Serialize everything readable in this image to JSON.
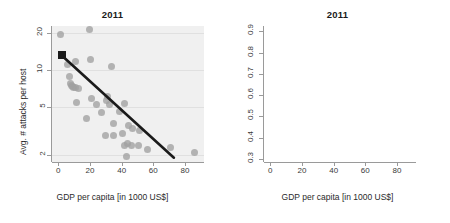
{
  "figure": {
    "background_color": "#ffffff",
    "panel_background_color": "#f0f0f0",
    "point_color": "#a0a0a0",
    "trend_color": "#1a1a1a",
    "marker_color": "#1a1a1a"
  },
  "chart_data": [
    {
      "type": "scatter",
      "title": "2011",
      "xlabel": "GDP per capita [in 1000 US$]",
      "ylabel": "Avg. # attacks per host",
      "xlim": [
        -4,
        92
      ],
      "ylim": [
        1.75,
        23
      ],
      "yscale": "log",
      "xscale": "linear",
      "grid": true,
      "legend": "none",
      "xticks": [
        0,
        20,
        40,
        60,
        80
      ],
      "yticks": [
        2,
        5,
        10,
        20
      ],
      "points": [
        {
          "x": 1.5,
          "y": 19.6
        },
        {
          "x": 2.0,
          "y": 13.2
        },
        {
          "x": 5.5,
          "y": 11.0
        },
        {
          "x": 7.0,
          "y": 8.9
        },
        {
          "x": 7.5,
          "y": 7.8
        },
        {
          "x": 8.0,
          "y": 7.5
        },
        {
          "x": 9.0,
          "y": 7.3
        },
        {
          "x": 9.5,
          "y": 7.2
        },
        {
          "x": 10.5,
          "y": 7.2
        },
        {
          "x": 11.0,
          "y": 11.8
        },
        {
          "x": 11.5,
          "y": 5.4
        },
        {
          "x": 13.0,
          "y": 7.1
        },
        {
          "x": 17.5,
          "y": 4.0
        },
        {
          "x": 19.5,
          "y": 21.5
        },
        {
          "x": 20.0,
          "y": 12.3
        },
        {
          "x": 21.0,
          "y": 5.8
        },
        {
          "x": 24.0,
          "y": 5.2
        },
        {
          "x": 27.5,
          "y": 4.5
        },
        {
          "x": 29.5,
          "y": 2.9
        },
        {
          "x": 30.5,
          "y": 5.6
        },
        {
          "x": 31.0,
          "y": 6.0
        },
        {
          "x": 32.5,
          "y": 5.2
        },
        {
          "x": 33.5,
          "y": 10.7
        },
        {
          "x": 34.5,
          "y": 3.6
        },
        {
          "x": 35.0,
          "y": 2.9
        },
        {
          "x": 38.5,
          "y": 4.6
        },
        {
          "x": 40.5,
          "y": 3.0
        },
        {
          "x": 41.5,
          "y": 5.3
        },
        {
          "x": 42.0,
          "y": 2.4
        },
        {
          "x": 43.0,
          "y": 1.95
        },
        {
          "x": 43.5,
          "y": 2.5
        },
        {
          "x": 44.5,
          "y": 3.5
        },
        {
          "x": 46.0,
          "y": 2.4
        },
        {
          "x": 47.0,
          "y": 3.3
        },
        {
          "x": 50.5,
          "y": 2.4
        },
        {
          "x": 51.5,
          "y": 3.2
        },
        {
          "x": 56.5,
          "y": 2.2
        },
        {
          "x": 70.5,
          "y": 2.3
        },
        {
          "x": 86.0,
          "y": 2.1
        }
      ],
      "trend": {
        "style": "straight-on-log",
        "start": {
          "x": 2.0,
          "y": 13.2
        },
        "end": {
          "x": 73.0,
          "y": 1.9
        }
      },
      "highlight_marker": {
        "x": 2.0,
        "y": 13.2,
        "shape": "square"
      }
    },
    {
      "type": "scatter",
      "title": "2011",
      "xlabel": "GDP per capita [in 1000 US$]",
      "ylabel": "% attacked hosts",
      "xlim": [
        -4,
        92
      ],
      "ylim": [
        0.285,
        0.925
      ],
      "yscale": "linear",
      "xscale": "linear",
      "grid": true,
      "legend": "none",
      "xticks": [
        0,
        20,
        40,
        60,
        80
      ],
      "yticks": [
        0.3,
        0.4,
        0.5,
        0.6,
        0.7,
        0.8,
        0.9
      ],
      "points": [
        {
          "x": 1.0,
          "y": 0.805
        },
        {
          "x": 2.0,
          "y": 0.79
        },
        {
          "x": 2.5,
          "y": 0.77
        },
        {
          "x": 3.5,
          "y": 0.73
        },
        {
          "x": 4.5,
          "y": 0.82
        },
        {
          "x": 5.0,
          "y": 0.69
        },
        {
          "x": 5.5,
          "y": 0.655
        },
        {
          "x": 6.0,
          "y": 0.66
        },
        {
          "x": 6.5,
          "y": 0.63
        },
        {
          "x": 7.5,
          "y": 0.775
        },
        {
          "x": 9.5,
          "y": 0.76
        },
        {
          "x": 10.5,
          "y": 0.755
        },
        {
          "x": 11.0,
          "y": 0.75
        },
        {
          "x": 11.5,
          "y": 0.72
        },
        {
          "x": 12.0,
          "y": 0.595
        },
        {
          "x": 13.0,
          "y": 0.7
        },
        {
          "x": 17.5,
          "y": 0.515
        },
        {
          "x": 19.0,
          "y": 0.76
        },
        {
          "x": 20.5,
          "y": 0.905
        },
        {
          "x": 21.5,
          "y": 0.69
        },
        {
          "x": 24.5,
          "y": 0.555
        },
        {
          "x": 26.5,
          "y": 0.63
        },
        {
          "x": 27.5,
          "y": 0.62
        },
        {
          "x": 29.5,
          "y": 0.445
        },
        {
          "x": 30.5,
          "y": 0.605
        },
        {
          "x": 31.5,
          "y": 0.61
        },
        {
          "x": 32.5,
          "y": 0.725
        },
        {
          "x": 33.5,
          "y": 0.53
        },
        {
          "x": 34.0,
          "y": 0.5
        },
        {
          "x": 35.5,
          "y": 0.505
        },
        {
          "x": 38.0,
          "y": 0.43
        },
        {
          "x": 39.5,
          "y": 0.6
        },
        {
          "x": 41.5,
          "y": 0.485
        },
        {
          "x": 42.5,
          "y": 0.325
        },
        {
          "x": 43.0,
          "y": 0.345
        },
        {
          "x": 44.5,
          "y": 0.49
        },
        {
          "x": 46.5,
          "y": 0.495
        },
        {
          "x": 48.0,
          "y": 0.49
        },
        {
          "x": 49.5,
          "y": 0.38
        },
        {
          "x": 51.0,
          "y": 0.49
        },
        {
          "x": 56.5,
          "y": 0.36
        },
        {
          "x": 70.5,
          "y": 0.385
        },
        {
          "x": 86.0,
          "y": 0.36
        }
      ],
      "trend": {
        "style": "curved-decay",
        "start": {
          "x": 2.0,
          "y": 0.775
        },
        "end": {
          "x": 85.0,
          "y": 0.31
        }
      },
      "highlight_marker": {
        "x": 2.0,
        "y": 0.775,
        "shape": "square"
      }
    }
  ]
}
